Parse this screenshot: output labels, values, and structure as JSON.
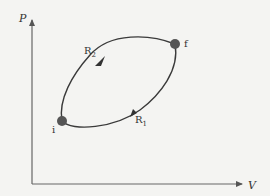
{
  "diagram": {
    "type": "pv-cycle",
    "axes": {
      "y_label": "P",
      "x_label": "V"
    },
    "points": [
      {
        "id": "i",
        "label": "i"
      },
      {
        "id": "f",
        "label": "f"
      }
    ],
    "paths": [
      {
        "id": "R1",
        "label_main": "R",
        "label_sub": "1",
        "from": "i",
        "to": "f",
        "direction": "lower path, i to f"
      },
      {
        "id": "R2",
        "label_main": "R",
        "label_sub": "2",
        "from": "f",
        "to": "i",
        "direction": "upper path, f to i"
      }
    ],
    "colors": {
      "line": "#3a3a3a",
      "axis": "#555555",
      "point": "#555555",
      "background": "#f4f4f2"
    }
  }
}
